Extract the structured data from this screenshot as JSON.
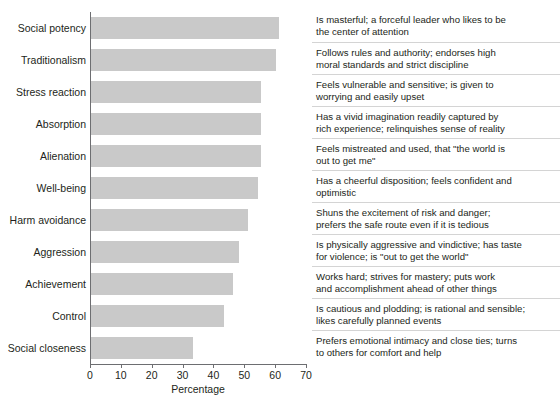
{
  "chart_data": {
    "type": "bar",
    "orientation": "horizontal",
    "title": "",
    "xlabel": "Percentage",
    "ylabel": "",
    "xlim": [
      0,
      70
    ],
    "xticks": [
      0,
      10,
      20,
      30,
      40,
      50,
      60,
      70
    ],
    "grid": false,
    "legend": null,
    "bar_color": "#c9c9c9",
    "axis_color": "#6d6e71",
    "text_color": "#231f20",
    "categories": [
      "Social potency",
      "Traditionalism",
      "Stress reaction",
      "Absorption",
      "Alienation",
      "Well-being",
      "Harm avoidance",
      "Aggression",
      "Achievement",
      "Control",
      "Social closeness"
    ],
    "values": [
      61,
      60,
      55,
      55,
      55,
      54,
      51,
      48,
      46,
      43,
      33
    ],
    "annotations": [
      "Is masterful; a forceful leader who likes to be\nthe center of attention",
      "Follows rules and authority; endorses high\nmoral standards and strict discipline",
      "Feels vulnerable and sensitive; is given to\nworrying and easily upset",
      "Has a vivid imagination readily captured by\nrich experience; relinquishes sense of reality",
      "Feels mistreated and used, that \"the world is\nout to get me\"",
      "Has a cheerful disposition; feels confident and\noptimistic",
      "Shuns the excitement of risk and danger;\nprefers the safe route even if it is tedious",
      "Is physically aggressive and vindictive; has taste\nfor violence; is \"out to get the world\"",
      "Works hard; strives for mastery; puts work\nand accomplishment ahead of other things",
      "Is cautious and plodding; is rational and sensible;\nlikes carefully planned events",
      "Prefers emotional intimacy and close ties; turns\nto others for comfort and help"
    ]
  }
}
